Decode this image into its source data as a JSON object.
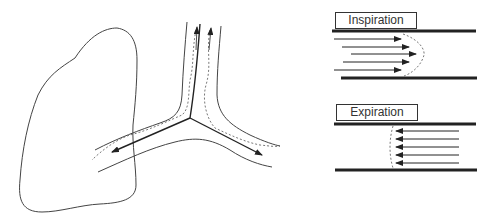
{
  "figure": {
    "left_panel": {
      "description": "Lung outline with branching airway; dashed flow profile and arrows show airflow directions",
      "elements": [
        "lung-outline",
        "trachea",
        "left-bronchus",
        "right-bronchus",
        "flow-arrows",
        "dashed-velocity-profiles"
      ]
    },
    "right_panel": {
      "inspiration": {
        "label": "Inspiration",
        "arrow_direction": "right",
        "arrow_count": 5,
        "profile": "parabolic"
      },
      "expiration": {
        "label": "Expiration",
        "arrow_direction": "left",
        "arrow_count": 5,
        "profile": "flat"
      }
    },
    "colors": {
      "line": "#222222",
      "background": "#ffffff"
    }
  }
}
